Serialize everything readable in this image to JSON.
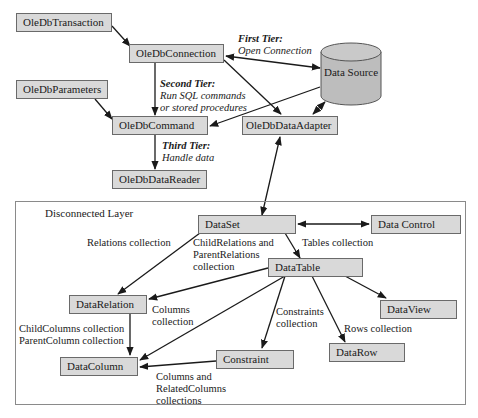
{
  "connected": {
    "boxes": {
      "transaction": "OleDbTransaction",
      "connection": "OleDbConnection",
      "parameters": "OleDbParameters",
      "command": "OleDbCommand",
      "data_adapter": "OleDbDataAdapter",
      "data_reader": "OleDbDataReader"
    },
    "data_source": "Data Source",
    "tiers": {
      "first_title": "First Tier:",
      "first_desc": "Open Connection",
      "second_title": "Second Tier:",
      "second_desc_1": "Run SQL commands",
      "second_desc_2": "or stored procedures",
      "third_title": "Third Tier:",
      "third_desc": "Handle data"
    }
  },
  "disconnected": {
    "title": "Disconnected Layer",
    "boxes": {
      "dataset": "DataSet",
      "data_control": "Data Control",
      "datatable": "DataTable",
      "datarelation": "DataRelation",
      "dataview": "DataView",
      "datacolumn": "DataColumn",
      "constraint": "Constraint",
      "datarow": "DataRow"
    },
    "labels": {
      "relations_collection": "Relations collection",
      "child_parent_relations_1": "ChildRelations and",
      "child_parent_relations_2": "ParentRelations",
      "child_parent_relations_3": "collection",
      "tables_collection": "Tables collection",
      "columns_collection_1": "Columns",
      "columns_collection_2": "collection",
      "child_columns": "ChildColumns collection",
      "parent_column": "ParentColumn collection",
      "constraints_collection_1": "Constraints",
      "constraints_collection_2": "collection",
      "rows_collection": "Rows collection",
      "columns_related_1": "Columns and",
      "columns_related_2": "RelatedColumns",
      "columns_related_3": "collections"
    }
  },
  "colors": {
    "box_fill": "#d9d9d9",
    "cylinder_fill": "#bdbdbd",
    "line": "#1a1a1a"
  }
}
